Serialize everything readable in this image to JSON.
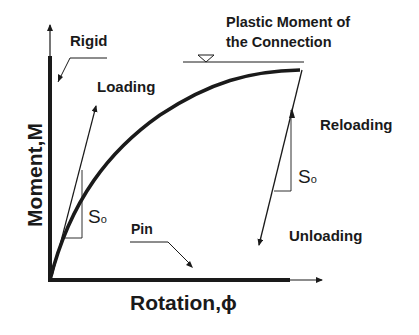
{
  "diagram": {
    "type": "moment-rotation curve",
    "axes": {
      "x_label": "Rotation,ϕ",
      "y_label": "Moment,M"
    },
    "annotations": {
      "rigid": "Rigid",
      "loading": "Loading",
      "plastic_moment_line1": "Plastic Moment of",
      "plastic_moment_line2": "the Connection",
      "reloading": "Reloading",
      "unloading": "Unloading",
      "pin": "Pin",
      "initial_stiffness_left": "S",
      "initial_stiffness_left_sub": "o",
      "initial_stiffness_right": "S",
      "initial_stiffness_right_sub": "o"
    },
    "colors": {
      "line": "#1a1a1a",
      "background": "#ffffff"
    }
  }
}
